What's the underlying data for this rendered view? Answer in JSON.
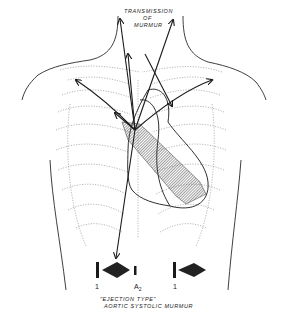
{
  "title": {
    "line1": "TRANSMISSION",
    "line2": "OF",
    "line3": "MURMUR"
  },
  "phonocardiogram": {
    "s1_left_label": "1",
    "a2_label": "A",
    "a2_sub": "2",
    "s1_right_label": "1",
    "caption_line1": "\"EJECTION TYPE\"",
    "caption_line2": "AORTIC SYSTOLIC MURMUR"
  },
  "colors": {
    "ink": "#1a1a1a",
    "ribs": "#9a9a9a",
    "hatch": "#555555",
    "background": "#ffffff"
  }
}
